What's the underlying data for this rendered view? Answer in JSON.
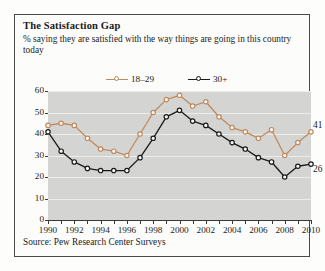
{
  "panel": {
    "title": "The Satisfaction Gap",
    "subtitle": "% saying they are satisfied with the way things are going in this country today",
    "source": "Source: Pew Research Center Surveys"
  },
  "colors": {
    "young_line": "#c08a5e",
    "old_line": "#1a1a1a",
    "plot_background": "#d4d4d2",
    "gridline": "#ececeb",
    "axis": "#3a3a38",
    "panel_border": "#4a4a48"
  },
  "chart_data": {
    "type": "line",
    "title": "The Satisfaction Gap",
    "subtitle": "% saying they are satisfied with the way things are going in this country today",
    "xlabel": "",
    "ylabel": "",
    "xlim": [
      1990,
      2010
    ],
    "ylim": [
      0,
      60
    ],
    "yticks": [
      0,
      10,
      20,
      30,
      40,
      50,
      60
    ],
    "ytick_labels": [
      "0",
      "10",
      "20",
      "30",
      "40",
      "50",
      "60"
    ],
    "xticks": [
      1990,
      1991,
      1992,
      1993,
      1994,
      1995,
      1996,
      1997,
      1998,
      1999,
      2000,
      2001,
      2002,
      2003,
      2004,
      2005,
      2006,
      2007,
      2008,
      2009,
      2010
    ],
    "xtick_labels": [
      "1990",
      "",
      "1992",
      "",
      "1994",
      "",
      "1996",
      "",
      "1998",
      "",
      "2000",
      "",
      "2002",
      "",
      "2004",
      "",
      "2006",
      "",
      "2008",
      "",
      "2010"
    ],
    "grid": true,
    "legend_position": "top-center",
    "markers": "open-circle",
    "x": [
      1990,
      1991,
      1992,
      1993,
      1994,
      1995,
      1996,
      1997,
      1998,
      1999,
      2000,
      2001,
      2002,
      2003,
      2004,
      2005,
      2006,
      2007,
      2008,
      2009,
      2010
    ],
    "series": [
      {
        "name": "18–29",
        "color": "#c08a5e",
        "values": [
          44,
          45,
          44,
          38,
          33,
          32,
          30,
          40,
          50,
          56,
          58,
          53,
          55,
          48,
          43,
          41,
          38,
          42,
          30,
          36,
          41
        ],
        "end_label": "41"
      },
      {
        "name": "30+",
        "color": "#1a1a1a",
        "values": [
          41,
          32,
          27,
          24,
          23,
          23,
          23,
          29,
          38,
          48,
          51,
          46,
          44,
          40,
          36,
          33,
          29,
          27,
          20,
          25,
          26
        ],
        "end_label": "26"
      }
    ]
  }
}
